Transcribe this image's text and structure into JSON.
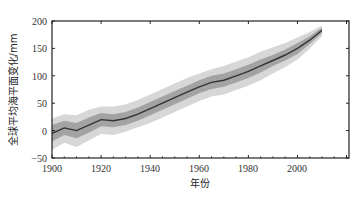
{
  "chart_data": {
    "type": "line",
    "title": "",
    "xlabel": "年份",
    "ylabel": "全球平均海平面变化/mm",
    "xlim": [
      1900,
      2021
    ],
    "ylim": [
      -50,
      200
    ],
    "x_ticks": [
      1900,
      1920,
      1940,
      1960,
      1980,
      2000
    ],
    "y_ticks": [
      -50,
      0,
      50,
      100,
      150,
      200
    ],
    "grid": false,
    "legend": null,
    "series": [
      {
        "name": "central estimate",
        "color": "#333333",
        "x": [
          1900,
          1905,
          1910,
          1915,
          1920,
          1925,
          1930,
          1935,
          1940,
          1945,
          1950,
          1955,
          1960,
          1965,
          1970,
          1975,
          1980,
          1985,
          1990,
          1995,
          2000,
          2005,
          2010
        ],
        "y": [
          -5,
          5,
          0,
          10,
          20,
          18,
          22,
          30,
          40,
          50,
          60,
          70,
          80,
          88,
          92,
          100,
          108,
          118,
          128,
          138,
          150,
          165,
          183
        ]
      },
      {
        "name": "uncertainty band (inner)",
        "color": "#9a9a9a",
        "upper": [
          10,
          18,
          14,
          24,
          32,
          30,
          34,
          42,
          52,
          62,
          72,
          82,
          92,
          100,
          104,
          112,
          120,
          130,
          138,
          148,
          160,
          172,
          188
        ],
        "lower": [
          -20,
          -8,
          -14,
          -4,
          8,
          6,
          10,
          18,
          28,
          38,
          48,
          58,
          68,
          76,
          80,
          88,
          96,
          106,
          118,
          128,
          140,
          158,
          178
        ]
      },
      {
        "name": "uncertainty band (outer)",
        "color": "#d0d0d0",
        "upper": [
          22,
          30,
          28,
          38,
          44,
          44,
          48,
          56,
          66,
          76,
          86,
          96,
          104,
          112,
          118,
          126,
          134,
          144,
          152,
          160,
          170,
          180,
          192
        ],
        "lower": [
          -35,
          -22,
          -30,
          -18,
          -6,
          -8,
          -2,
          6,
          14,
          24,
          34,
          44,
          54,
          62,
          66,
          74,
          82,
          92,
          104,
          116,
          130,
          150,
          172
        ]
      }
    ]
  },
  "labels": {
    "x_title": "年份",
    "y_title": "全球平均海平面变化/mm",
    "x_ticks": [
      "1900",
      "1920",
      "1940",
      "1960",
      "1980",
      "2000"
    ],
    "y_ticks": [
      "200",
      "150",
      "100",
      "50",
      "0",
      "−50"
    ]
  }
}
